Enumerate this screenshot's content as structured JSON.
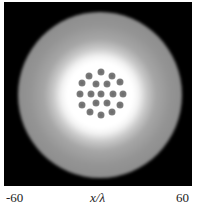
{
  "figure": {
    "colors": {
      "background": "#000000",
      "halo": "#8a8a8a",
      "core": "#ffffff",
      "dot": "#707070"
    },
    "dots": [
      {
        "x": 101,
        "y": 72
      },
      {
        "x": 89,
        "y": 76
      },
      {
        "x": 112,
        "y": 76
      },
      {
        "x": 82,
        "y": 83
      },
      {
        "x": 96,
        "y": 84
      },
      {
        "x": 107,
        "y": 84
      },
      {
        "x": 120,
        "y": 82
      },
      {
        "x": 80,
        "y": 94
      },
      {
        "x": 91,
        "y": 94
      },
      {
        "x": 101,
        "y": 94
      },
      {
        "x": 113,
        "y": 94
      },
      {
        "x": 123,
        "y": 94
      },
      {
        "x": 82,
        "y": 105
      },
      {
        "x": 96,
        "y": 103
      },
      {
        "x": 107,
        "y": 103
      },
      {
        "x": 120,
        "y": 105
      },
      {
        "x": 90,
        "y": 112
      },
      {
        "x": 101,
        "y": 115
      },
      {
        "x": 112,
        "y": 112
      }
    ]
  },
  "axis": {
    "x_min_label": "-60",
    "x_title": "x/λ",
    "x_max_label": "60"
  }
}
